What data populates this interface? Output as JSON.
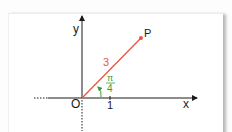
{
  "diagram": {
    "type": "polar-coordinate-illustration",
    "axes": {
      "x_label": "x",
      "y_label": "y",
      "origin_label": "O",
      "tick_label": "1"
    },
    "point": {
      "label": "P",
      "radius_label": "3",
      "angle_label_numerator": "π",
      "angle_label_denominator": "4"
    },
    "colors": {
      "axis": "#1a1a1a",
      "segment": "#e8553f",
      "point": "#e8553f",
      "radius_label": "#e8553f",
      "angle": "#3a9a3a",
      "panel_bg": "#ffffff"
    }
  }
}
